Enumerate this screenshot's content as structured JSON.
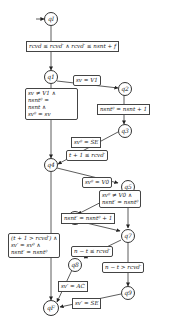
{
  "nodes": {
    "qI": "qI",
    "q1": "q1",
    "q2": "q2",
    "q3": "q3",
    "q4": "q4",
    "q5": "q5",
    "q6": "q6",
    "q7": "q7",
    "q8": "q8",
    "q9": "q9",
    "qF": "qF"
  },
  "labels": {
    "init": "rcvd ≤ rcvd′ ∧ rcvd′ ≤ nsnt + f",
    "q1_q2": "sv = V1",
    "q2_q3": "nsnt⁰ = nsnt + 1",
    "q1_q4": [
      "sv ≠ V1 ∧",
      "nsnt⁰ =",
      "nsnt ∧",
      "sv⁰ = sv"
    ],
    "q3_q4": "sv⁰ = SE",
    "q4_q5": "t + 1 ≤ rcvd′",
    "q5_q6": "sv⁰ = V0",
    "q5_q7": [
      "sv⁰ ≠ V0 ∧",
      "nsnt′ = nsnt⁰"
    ],
    "q6_q7": "nsnt′ = nsnt⁰ + 1",
    "q4_qF": [
      "(t + 1 > rcvd′) ∧",
      "sv′ = sv⁰ ∧",
      "nsnt′ = nsnt⁰"
    ],
    "q7_q8": "n − t ≤ rcvd′",
    "q7_q9": "n − t > rcvd′",
    "q8_qF": "sv′ = AC",
    "q9_qF": "sv′ = SE"
  }
}
